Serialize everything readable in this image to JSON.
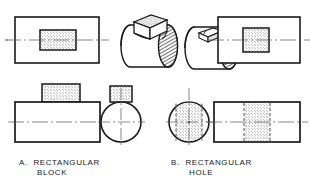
{
  "figure": {
    "type": "orthographic-projection-plate",
    "background_color": "#ffffff",
    "line_color": "#1a1a1a",
    "section_fill_color": "#e8e8e8"
  },
  "captions": {
    "a": {
      "label": "A.",
      "line1": "RECTANGULAR",
      "line2": "BLOCK"
    },
    "b": {
      "label": "B.",
      "line1": "RECTANGULAR",
      "line2": "HOLE"
    }
  },
  "views": {
    "a_top": {
      "name": "top-view-rectangular-block",
      "outline": "rectangle",
      "feature": "stippled-rectangle",
      "centerline": "horizontal"
    },
    "a_pictorial": {
      "name": "isometric-cylinder-with-block",
      "description": "horizontal cylinder with rectangular block protruding from top"
    },
    "a_front": {
      "name": "front-view-rectangular-block",
      "outline": "rectangle",
      "feature": "stippled-rectangle-on-top",
      "centerline": "horizontal"
    },
    "a_side": {
      "name": "side-view-rectangular-block",
      "outline": "circle",
      "feature": "stippled-rectangle-on-top",
      "centerline": "crosshair"
    },
    "b_side": {
      "name": "side-view-rectangular-hole",
      "outline": "circle",
      "feature": "stippled-vertical-band-with-hidden-lines",
      "centerline": "crosshair"
    },
    "b_front": {
      "name": "front-view-rectangular-hole",
      "outline": "rectangle",
      "feature": "stippled-vertical-band-with-hidden-lines",
      "centerline": "horizontal"
    },
    "b_pictorial": {
      "name": "isometric-cylinder-with-hole",
      "description": "horizontal cylinder with rectangular hole cut into top"
    },
    "b_top": {
      "name": "top-view-rectangular-hole",
      "outline": "rectangle",
      "feature": "stippled-square",
      "centerline": "horizontal"
    }
  }
}
